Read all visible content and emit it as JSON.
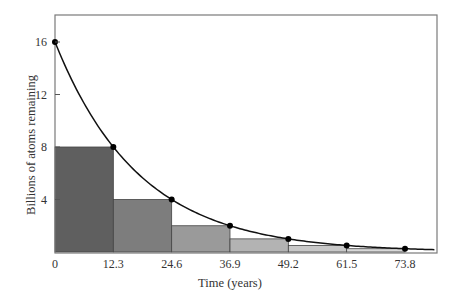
{
  "chart_data": {
    "type": "bar",
    "title": "",
    "xlabel": "Time (years)",
    "ylabel": "Billions of atoms remaining",
    "xlim": [
      0,
      80
    ],
    "ylim": [
      0,
      18
    ],
    "x_ticks": [
      "0",
      "12.3",
      "24.6",
      "36.9",
      "49.2",
      "61.5",
      "73.8"
    ],
    "y_ticks": [
      "4",
      "8",
      "12",
      "16"
    ],
    "grid": false,
    "legend": null,
    "bars": {
      "x_start": [
        0,
        12.3,
        24.6,
        36.9,
        49.2,
        61.5
      ],
      "x_end": [
        12.3,
        24.6,
        36.9,
        49.2,
        61.5,
        73.8
      ],
      "values": [
        8,
        4,
        2,
        1,
        0.5,
        0.25
      ],
      "colors": [
        "#5f5f5f",
        "#7d7d7d",
        "#9a9a9a",
        "#b3b3b3",
        "#c8c8c8",
        "#d8d8d8"
      ]
    },
    "curve": {
      "name": "exponential decay",
      "x": [
        0,
        12.3,
        24.6,
        36.9,
        49.2,
        61.5,
        73.8
      ],
      "values": [
        16,
        8,
        4,
        2,
        1,
        0.5,
        0.25
      ],
      "half_life": 12.3
    }
  }
}
